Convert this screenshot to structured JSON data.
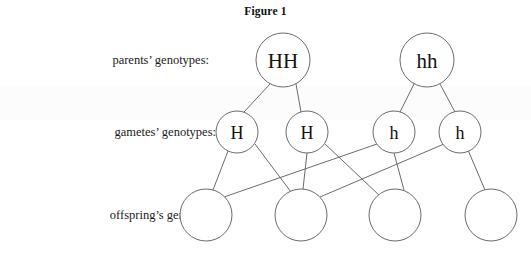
{
  "figure": {
    "title": "Figure 1",
    "background_color": "#ffffff",
    "line_color": "#6b6b6b",
    "text_color": "#111111"
  },
  "row_labels": {
    "parents": "parents’ genotypes:",
    "gametes": "gametes’ genotypes:",
    "offspring": "offspring’s genotypes:"
  },
  "rows": {
    "parents": {
      "nodes": [
        {
          "label": "HH",
          "cx": 283,
          "cy": 60,
          "r": 27
        },
        {
          "label": "hh",
          "cx": 427,
          "cy": 60,
          "r": 27
        }
      ]
    },
    "gametes": {
      "nodes": [
        {
          "label": "H",
          "cx": 237,
          "cy": 132,
          "r": 21
        },
        {
          "label": "H",
          "cx": 307,
          "cy": 132,
          "r": 21
        },
        {
          "label": "h",
          "cx": 394,
          "cy": 132,
          "r": 21
        },
        {
          "label": "h",
          "cx": 460,
          "cy": 132,
          "r": 21
        }
      ]
    },
    "offspring": {
      "nodes": [
        {
          "label": "",
          "cx": 206,
          "cy": 215,
          "r": 26
        },
        {
          "label": "",
          "cx": 301,
          "cy": 215,
          "r": 26
        },
        {
          "label": "",
          "cx": 395,
          "cy": 215,
          "r": 26
        },
        {
          "label": "",
          "cx": 491,
          "cy": 215,
          "r": 26
        }
      ]
    }
  },
  "edges": {
    "parent_to_gamete": [
      {
        "from": "parent-hh-dominant",
        "to": "gamete-h-1",
        "x1": 270,
        "y1": 84,
        "x2": 244,
        "y2": 112
      },
      {
        "from": "parent-hh-dominant",
        "to": "gamete-h-2",
        "x1": 296,
        "y1": 84,
        "x2": 301,
        "y2": 112
      },
      {
        "from": "parent-hh-recessive",
        "to": "gamete-h-3",
        "x1": 414,
        "y1": 84,
        "x2": 400,
        "y2": 112
      },
      {
        "from": "parent-hh-recessive",
        "to": "gamete-h-4",
        "x1": 440,
        "y1": 84,
        "x2": 455,
        "y2": 112
      }
    ],
    "gamete_to_offspring": [
      {
        "from": "gamete-h-1",
        "to": "offspring-1",
        "x1": 228,
        "y1": 151,
        "x2": 213,
        "y2": 190
      },
      {
        "from": "gamete-h-1",
        "to": "offspring-2",
        "x1": 255,
        "y1": 144,
        "x2": 291,
        "y2": 192
      },
      {
        "from": "gamete-h-2",
        "to": "offspring-2",
        "x1": 307,
        "y1": 153,
        "x2": 303,
        "y2": 189
      },
      {
        "from": "gamete-h-2",
        "to": "offspring-3",
        "x1": 325,
        "y1": 144,
        "x2": 380,
        "y2": 196
      },
      {
        "from": "gamete-h-3",
        "to": "offspring-1",
        "x1": 377,
        "y1": 144,
        "x2": 224,
        "y2": 197
      },
      {
        "from": "gamete-h-3",
        "to": "offspring-3",
        "x1": 394,
        "y1": 153,
        "x2": 404,
        "y2": 190
      },
      {
        "from": "gamete-h-4",
        "to": "offspring-2",
        "x1": 444,
        "y1": 144,
        "x2": 320,
        "y2": 197
      },
      {
        "from": "gamete-h-4",
        "to": "offspring-4",
        "x1": 468,
        "y1": 150,
        "x2": 485,
        "y2": 190
      }
    ]
  }
}
